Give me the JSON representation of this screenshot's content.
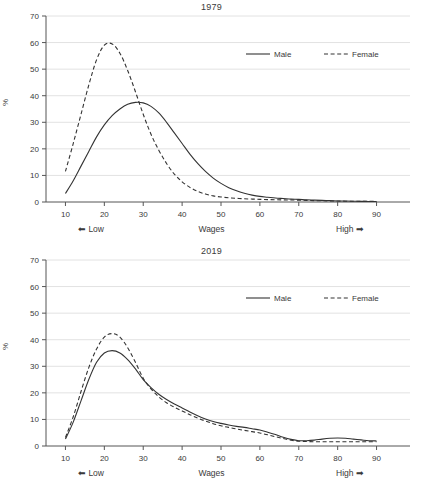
{
  "figure": {
    "ylabel": "%",
    "xlabel": "Wages",
    "low_label": "Low",
    "high_label": "High",
    "left_arrow_icon": "left-arrow-icon",
    "right_arrow_icon": "right-arrow-icon",
    "line_color": "#333333",
    "grid_color": "#e2e2e2",
    "axis_color": "#555555",
    "background": "#ffffff"
  },
  "chart_data": [
    {
      "type": "line",
      "title": "1979",
      "xlabel": "Wages",
      "ylabel": "%",
      "xlim": [
        5,
        95
      ],
      "ylim": [
        0,
        70
      ],
      "xticks": [
        10,
        20,
        30,
        40,
        50,
        60,
        70,
        80,
        90
      ],
      "yticks": [
        0,
        10,
        20,
        30,
        40,
        50,
        60,
        70
      ],
      "grid": "horizontal",
      "legend_position": "upper right",
      "x": [
        10,
        12,
        14,
        16,
        18,
        20,
        22,
        24,
        26,
        28,
        30,
        32,
        34,
        36,
        38,
        40,
        42,
        44,
        46,
        48,
        50,
        52,
        54,
        56,
        58,
        60,
        62,
        64,
        66,
        68,
        70,
        72,
        74,
        76,
        78,
        80,
        82,
        84,
        86,
        88,
        90
      ],
      "series": [
        {
          "name": "Male",
          "style": "solid",
          "values": [
            3.2,
            8.0,
            13.5,
            19.0,
            24.5,
            29.0,
            32.5,
            35.0,
            36.8,
            37.5,
            37.3,
            36.0,
            33.5,
            30.0,
            26.0,
            22.0,
            18.0,
            14.5,
            11.5,
            9.0,
            7.0,
            5.4,
            4.2,
            3.3,
            2.6,
            2.1,
            1.8,
            1.5,
            1.3,
            1.1,
            1.0,
            0.8,
            0.7,
            0.6,
            0.5,
            0.4,
            0.35,
            0.3,
            0.25,
            0.2,
            0.2
          ]
        },
        {
          "name": "Female",
          "style": "dashed",
          "values": [
            11.5,
            22.0,
            33.0,
            44.0,
            53.5,
            59.0,
            59.5,
            56.0,
            49.5,
            41.5,
            33.0,
            25.5,
            19.5,
            14.5,
            10.5,
            7.6,
            5.5,
            4.0,
            3.0,
            2.3,
            1.9,
            1.6,
            1.4,
            1.2,
            1.1,
            1.0,
            0.9,
            0.85,
            0.8,
            0.75,
            0.7,
            0.6,
            0.5,
            0.45,
            0.4,
            0.35,
            0.3,
            0.3,
            0.25,
            0.25,
            0.2
          ]
        }
      ]
    },
    {
      "type": "line",
      "title": "2019",
      "xlabel": "Wages",
      "ylabel": "%",
      "xlim": [
        5,
        95
      ],
      "ylim": [
        0,
        70
      ],
      "xticks": [
        10,
        20,
        30,
        40,
        50,
        60,
        70,
        80,
        90
      ],
      "yticks": [
        0,
        10,
        20,
        30,
        40,
        50,
        60,
        70
      ],
      "grid": "horizontal",
      "legend_position": "upper right",
      "x": [
        10,
        12,
        14,
        16,
        18,
        20,
        22,
        24,
        26,
        28,
        30,
        32,
        34,
        36,
        38,
        40,
        42,
        44,
        46,
        48,
        50,
        52,
        54,
        56,
        58,
        60,
        62,
        64,
        66,
        68,
        70,
        72,
        74,
        76,
        78,
        80,
        82,
        84,
        86,
        88,
        90
      ],
      "series": [
        {
          "name": "Male",
          "style": "solid",
          "values": [
            2.6,
            9.0,
            17.0,
            25.0,
            31.5,
            35.0,
            35.9,
            35.0,
            32.5,
            29.0,
            25.0,
            22.0,
            19.5,
            17.5,
            15.8,
            14.3,
            12.8,
            11.4,
            10.2,
            9.2,
            8.5,
            7.9,
            7.4,
            7.0,
            6.5,
            6.0,
            5.2,
            4.3,
            3.3,
            2.5,
            2.0,
            2.0,
            2.2,
            2.6,
            2.9,
            3.0,
            2.9,
            2.6,
            2.3,
            2.0,
            1.9
          ]
        },
        {
          "name": "Female",
          "style": "dashed",
          "values": [
            3.2,
            11.0,
            20.5,
            29.5,
            36.5,
            41.0,
            42.3,
            41.0,
            37.0,
            31.5,
            25.5,
            21.5,
            18.5,
            16.3,
            14.6,
            13.2,
            11.8,
            10.5,
            9.4,
            8.4,
            7.6,
            7.0,
            6.4,
            5.9,
            5.4,
            4.9,
            4.2,
            3.5,
            2.8,
            2.2,
            1.8,
            1.7,
            1.6,
            1.6,
            1.6,
            1.6,
            1.6,
            1.6,
            1.6,
            1.6,
            1.6
          ]
        }
      ]
    }
  ]
}
